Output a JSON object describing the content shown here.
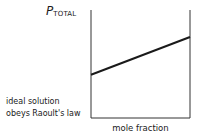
{
  "chart_data": {
    "type": "line",
    "title": "",
    "ylabel": {
      "symbol": "P",
      "subscript": "TOTAL"
    },
    "xlabel": "mole fraction",
    "annotation": [
      "ideal solution",
      "obeys Raoult's law"
    ],
    "x": [
      0,
      1
    ],
    "series": [
      {
        "name": "P_TOTAL (ideal)",
        "values": [
          0.4,
          0.75
        ]
      }
    ],
    "xlim": [
      0,
      1
    ],
    "ylim": [
      0,
      1
    ],
    "grid": false,
    "legend": "none",
    "ticks": "none",
    "colors": {
      "line": "#1a1a1a",
      "axes": "#333333"
    }
  }
}
